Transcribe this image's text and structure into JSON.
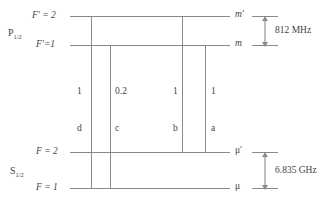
{
  "diagram": {
    "type": "energy-level-diagram",
    "line_color": "#8a8a8a",
    "text_color": "#3f3f3f",
    "background": "#ffffff",
    "manifolds": [
      {
        "id": "upper",
        "term_symbol": "P",
        "term_subscript": "1/2"
      },
      {
        "id": "lower",
        "term_symbol": "S",
        "term_subscript": "1/2"
      }
    ],
    "levels": [
      {
        "id": "Fp2",
        "left_label": "F′ = 2",
        "right_label": "m′",
        "manifold": "upper"
      },
      {
        "id": "Fp1",
        "left_label": "F′=1",
        "right_label": "m",
        "manifold": "upper"
      },
      {
        "id": "F2",
        "left_label": "F = 2",
        "right_label": "μ′",
        "manifold": "lower"
      },
      {
        "id": "F1",
        "left_label": "F = 1",
        "right_label": "μ",
        "manifold": "lower"
      }
    ],
    "transitions": [
      {
        "id": "d",
        "label": "d",
        "strength": "1",
        "from": "Fp2",
        "to": "F1"
      },
      {
        "id": "c",
        "label": "c",
        "strength": "0.2",
        "from": "Fp1",
        "to": "F1"
      },
      {
        "id": "b",
        "label": "b",
        "strength": "1",
        "from": "Fp2",
        "to": "F2"
      },
      {
        "id": "a",
        "label": "a",
        "strength": "1",
        "from": "Fp1",
        "to": "F2"
      }
    ],
    "splittings": [
      {
        "id": "upper-splitting",
        "value": "812 MHz",
        "between": [
          "Fp2",
          "Fp1"
        ]
      },
      {
        "id": "lower-splitting",
        "value": "6.835 GHz",
        "between": [
          "F2",
          "F1"
        ]
      }
    ]
  }
}
